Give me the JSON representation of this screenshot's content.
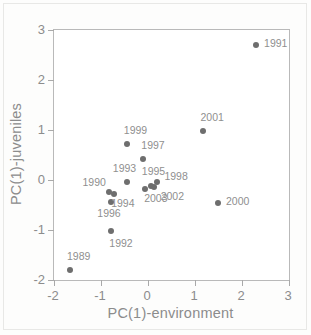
{
  "chart_data": {
    "type": "scatter",
    "title": "",
    "xlabel": "PC(1)-environment",
    "ylabel": "PC(1)-juveniles",
    "xlim": [
      -2,
      3
    ],
    "ylim": [
      -2,
      3
    ],
    "xticks": [
      "-2",
      "-1",
      "0",
      "1",
      "2",
      "3"
    ],
    "yticks": [
      "3",
      "2",
      "1",
      "0",
      "-1",
      "-2"
    ],
    "xtick_values": [
      -2,
      -1,
      0,
      1,
      2,
      3
    ],
    "ytick_values": [
      3,
      2,
      1,
      0,
      -1,
      -2
    ],
    "grid": false,
    "legend": "none",
    "marker_color": "#6e6e6e",
    "axis_color": "#b9b9b9",
    "text_color": "#8c8c8c",
    "points": [
      {
        "label": "1991",
        "x": 2.3,
        "y": 2.7,
        "label_dx": 9,
        "label_dy": -1
      },
      {
        "label": "2001",
        "x": 1.18,
        "y": 0.98,
        "label_dx": -2,
        "label_dy": -13
      },
      {
        "label": "2000",
        "x": 1.49,
        "y": -0.45,
        "label_dx": 9,
        "label_dy": -1
      },
      {
        "label": "1999",
        "x": -0.45,
        "y": 0.72,
        "label_dx": -2,
        "label_dy": -13
      },
      {
        "label": "1997",
        "x": -0.1,
        "y": 0.43,
        "label_dx": -1,
        "label_dy": -13
      },
      {
        "label": "1993",
        "x": -0.45,
        "y": -0.04,
        "label_dx": -13,
        "label_dy": -13
      },
      {
        "label": "1995",
        "x": 0.06,
        "y": -0.12,
        "label_dx": -8,
        "label_dy": -14
      },
      {
        "label": "1998",
        "x": 0.2,
        "y": -0.03,
        "label_dx": 8,
        "label_dy": -5
      },
      {
        "label": "1990",
        "x": -0.82,
        "y": -0.23,
        "label_dx": -26,
        "label_dy": -9
      },
      {
        "label": "1994",
        "x": -0.72,
        "y": -0.28,
        "label_dx": -2,
        "label_dy": 10
      },
      {
        "label": "1996",
        "x": -0.78,
        "y": -0.43,
        "label_dx": -13,
        "label_dy": 12
      },
      {
        "label": "2003",
        "x": -0.06,
        "y": -0.18,
        "label_dx": 0,
        "label_dy": 10
      },
      {
        "label": "2002",
        "x": 0.12,
        "y": -0.14,
        "label_dx": 8,
        "label_dy": 10
      },
      {
        "label": "1992",
        "x": -0.78,
        "y": -1.02,
        "label_dx": -1,
        "label_dy": 13
      },
      {
        "label": "1989",
        "x": -1.66,
        "y": -1.8,
        "label_dx": -2,
        "label_dy": -13
      }
    ]
  }
}
